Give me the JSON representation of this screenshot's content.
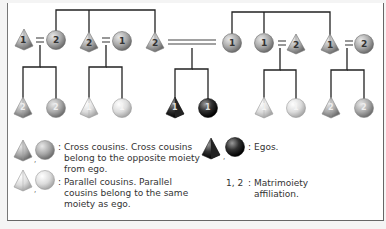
{
  "diagram": {
    "colors": {
      "line": "#222222",
      "cross_fill": "#a8a8a8",
      "parallel_fill": "#dcdcdc",
      "ego_fill": "#333333",
      "frame_border": "#666666"
    },
    "generation1": [
      {
        "id": "g1-1",
        "shape": "triangle",
        "moiety": "1",
        "tone": "mid"
      },
      {
        "id": "g1-2",
        "shape": "circle",
        "moiety": "2",
        "tone": "mid"
      },
      {
        "id": "g1-3",
        "shape": "triangle",
        "moiety": "2",
        "tone": "mid"
      },
      {
        "id": "g1-4",
        "shape": "circle",
        "moiety": "1",
        "tone": "mid"
      },
      {
        "id": "g1-5",
        "shape": "triangle",
        "moiety": "2",
        "tone": "mid"
      },
      {
        "id": "g1-6",
        "shape": "circle",
        "moiety": "1",
        "tone": "mid"
      },
      {
        "id": "g1-7",
        "shape": "circle",
        "moiety": "1",
        "tone": "mid"
      },
      {
        "id": "g1-8",
        "shape": "triangle",
        "moiety": "2",
        "tone": "mid"
      },
      {
        "id": "g1-9",
        "shape": "triangle",
        "moiety": "1",
        "tone": "mid"
      },
      {
        "id": "g1-10",
        "shape": "circle",
        "moiety": "2",
        "tone": "mid"
      }
    ],
    "marriage_sign": "=",
    "generation2": [
      {
        "id": "g2-1",
        "shape": "triangle",
        "moiety": "2",
        "type": "cross"
      },
      {
        "id": "g2-2",
        "shape": "circle",
        "moiety": "2",
        "type": "cross"
      },
      {
        "id": "g2-3",
        "shape": "triangle",
        "moiety": "1",
        "type": "parallel"
      },
      {
        "id": "g2-4",
        "shape": "circle",
        "moiety": "1",
        "type": "parallel"
      },
      {
        "id": "g2-5",
        "shape": "triangle",
        "moiety": "1",
        "type": "ego"
      },
      {
        "id": "g2-6",
        "shape": "circle",
        "moiety": "1",
        "type": "ego"
      },
      {
        "id": "g2-7",
        "shape": "triangle",
        "moiety": "1",
        "type": "parallel"
      },
      {
        "id": "g2-8",
        "shape": "circle",
        "moiety": "1",
        "type": "parallel"
      },
      {
        "id": "g2-9",
        "shape": "triangle",
        "moiety": "2",
        "type": "cross"
      },
      {
        "id": "g2-10",
        "shape": "circle",
        "moiety": "2",
        "type": "cross"
      }
    ]
  },
  "legend": {
    "cross": {
      "marker": ":",
      "line1": "Cross cousins. Cross cousins",
      "line2": "belong to the opposite moiety",
      "line3": "from ego."
    },
    "parallel": {
      "marker": ":",
      "line1": "Parallel cousins. Parallel",
      "line2": "cousins belong to the same",
      "line3": "moiety as ego."
    },
    "egos": {
      "marker": ":",
      "text": "Egos."
    },
    "matrimoiety": {
      "key": "1, 2",
      "marker": ":",
      "line1": "Matrimoiety",
      "line2": "affiliation."
    },
    "separator": ","
  }
}
